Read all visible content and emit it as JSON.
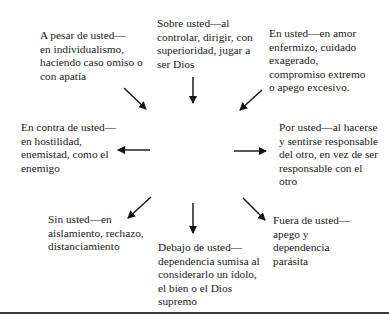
{
  "diagram": {
    "center": {
      "text": "En vez de (con\nusted)—en amor y\nequilibrio, en cuidado\ny confrontación\npositiva, en gracia y\nverdad"
    },
    "nodes": {
      "top_left": {
        "text": "A pesar de usted—\nen individualismo,\nhaciendo caso omiso o\ncon apatía"
      },
      "top": {
        "text": "Sobre usted—al\ncontrolar, dirigir, con\nsuperioridad, jugar a\nser Dios"
      },
      "top_right": {
        "text": "En usted—en amor\nenfermizo, cuidado\nexagerado,\ncompromiso extremo\no apego excesivo."
      },
      "left": {
        "text": "En contra de usted—\nen hostilidad,\nenemistad, como el\nenemigo"
      },
      "right": {
        "text": "Por usted—al hacerse\ny sentirse responsable\ndel otro, en vez de ser\nresponsable con el\notro"
      },
      "bottom_left": {
        "text": "Sin usted—en\naislamiento, rechazo,\ndistanciamiento"
      },
      "bottom": {
        "text": "Debajo de usted—\ndependencia sumisa al\nconsiderarlo un ídolo,\nel bien o el Dios\nsupremo"
      },
      "bottom_right": {
        "text": "Fuera de usted—\napego y\ndependencia\nparásita"
      }
    },
    "arrows": [
      {
        "from": "top_left",
        "to": "center"
      },
      {
        "from": "top",
        "to": "center"
      },
      {
        "from": "top_right",
        "to": "center"
      },
      {
        "from": "center",
        "to": "left"
      },
      {
        "from": "center",
        "to": "right"
      },
      {
        "from": "center",
        "to": "bottom_left"
      },
      {
        "from": "center",
        "to": "bottom"
      },
      {
        "from": "center",
        "to": "bottom_right"
      }
    ]
  }
}
